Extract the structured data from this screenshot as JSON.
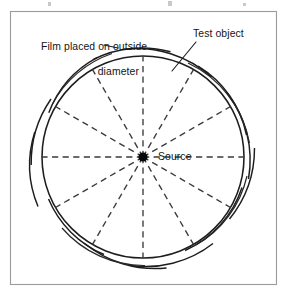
{
  "figure": {
    "domain": "Diagram",
    "background_color": "#ffffff",
    "frame": {
      "x": 10.5,
      "y": 11.5,
      "width": 266,
      "height": 273,
      "stroke_color": "#9b9b9b"
    },
    "labels": {
      "film_line_1": "Film placed on outside",
      "film_line_2": "diameter",
      "test_object": "Test object",
      "source": "Source"
    },
    "geometry": {
      "center_x": 143,
      "center_y": 157,
      "object_radius": 101,
      "source_dot_radius": 4.6,
      "spoke_count": 12,
      "spoke_angle_step_deg": 30,
      "spoke_start_angle_deg": 90,
      "film_arc_radii": [
        104.5,
        108.5,
        112
      ],
      "leader_from_x": 196,
      "leader_from_y": 42,
      "leader_to_x": 172,
      "leader_to_y": 71
    },
    "colors": {
      "ink": "#1d1d1d",
      "dashed_ray": "#3a3a3a",
      "frame": "#9b9b9b",
      "source_fill": "#090909",
      "label_text": "#141414"
    }
  }
}
